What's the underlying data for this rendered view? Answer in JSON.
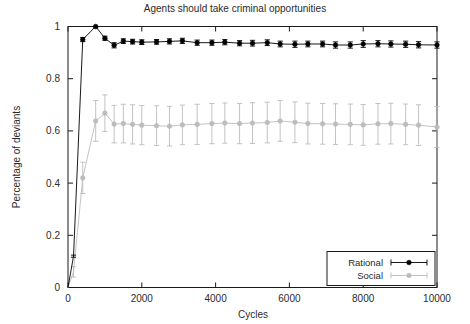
{
  "chart_data": {
    "type": "line",
    "title": "Agents should take criminal opportunities",
    "xlabel": "Cycles",
    "ylabel": "Percentage of deviants",
    "xlim": [
      0,
      10000
    ],
    "ylim": [
      0,
      1
    ],
    "xticks": [
      0,
      2000,
      4000,
      6000,
      8000,
      10000
    ],
    "xticklabels": [
      "0",
      "2000",
      "4000",
      "6000",
      "8000",
      "10000"
    ],
    "yticks": [
      0,
      0.2,
      0.4,
      0.6,
      0.8,
      1
    ],
    "yticklabels": [
      "0",
      "0.2",
      "0.4",
      "0.6",
      "0.8",
      "1"
    ],
    "grid": false,
    "legend_position": "lower right",
    "errorbars": true,
    "marker": "filled-circle",
    "x": [
      0,
      150,
      400,
      750,
      1000,
      1250,
      1500,
      1750,
      2000,
      2400,
      2750,
      3100,
      3500,
      3900,
      4250,
      4650,
      5000,
      5400,
      5750,
      6150,
      6500,
      6900,
      7250,
      7650,
      8000,
      8400,
      8750,
      9150,
      9500,
      10000
    ],
    "series": [
      {
        "name": "Rational",
        "color": "#000000",
        "values": [
          0.0,
          0.12,
          0.95,
          1.0,
          0.955,
          0.928,
          0.944,
          0.942,
          0.94,
          0.941,
          0.943,
          0.945,
          0.938,
          0.938,
          0.94,
          0.936,
          0.936,
          0.938,
          0.933,
          0.932,
          0.933,
          0.933,
          0.929,
          0.929,
          0.933,
          0.934,
          0.933,
          0.932,
          0.93,
          0.929
        ],
        "errors": [
          0.0,
          0.004,
          0.008,
          0.006,
          0.008,
          0.01,
          0.009,
          0.009,
          0.009,
          0.009,
          0.01,
          0.01,
          0.01,
          0.01,
          0.01,
          0.01,
          0.011,
          0.011,
          0.011,
          0.012,
          0.011,
          0.011,
          0.012,
          0.012,
          0.013,
          0.012,
          0.012,
          0.012,
          0.012,
          0.012
        ]
      },
      {
        "name": "Social",
        "color": "#bcbcbc",
        "values": [
          0.0,
          0.06,
          0.42,
          0.638,
          0.668,
          0.626,
          0.628,
          0.625,
          0.622,
          0.62,
          0.618,
          0.623,
          0.625,
          0.628,
          0.63,
          0.628,
          0.63,
          0.632,
          0.638,
          0.633,
          0.628,
          0.627,
          0.626,
          0.625,
          0.623,
          0.627,
          0.628,
          0.625,
          0.622,
          0.615
        ],
        "errors": [
          0.0,
          0.02,
          0.06,
          0.078,
          0.07,
          0.072,
          0.074,
          0.075,
          0.075,
          0.076,
          0.076,
          0.076,
          0.077,
          0.077,
          0.077,
          0.077,
          0.078,
          0.078,
          0.078,
          0.078,
          0.078,
          0.078,
          0.078,
          0.078,
          0.078,
          0.078,
          0.078,
          0.078,
          0.078,
          0.078
        ]
      }
    ]
  }
}
